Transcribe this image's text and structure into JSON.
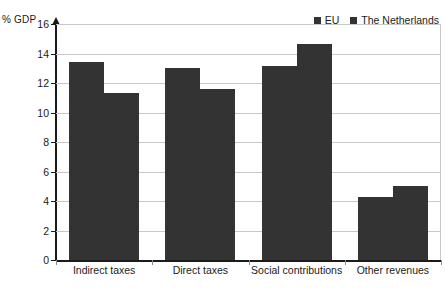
{
  "chart_data": {
    "type": "bar",
    "title": "",
    "subtitle": "",
    "xlabel": "",
    "ylabel": "% GDP",
    "ylim": [
      0,
      16
    ],
    "ytick_step": 2,
    "yticks": [
      16,
      14,
      12,
      10,
      8,
      6,
      4,
      2,
      0
    ],
    "grid": true,
    "legend_position": "top-right",
    "categories": [
      "Indirect taxes",
      "Direct taxes",
      "Social contributions",
      "Other revenues"
    ],
    "series": [
      {
        "name": "EU",
        "color": "#333333",
        "values": [
          13.4,
          13.0,
          13.15,
          4.3
        ]
      },
      {
        "name": "The Netherlands",
        "color": "#333333",
        "values": [
          11.3,
          11.6,
          14.65,
          5.0
        ]
      }
    ]
  },
  "colors": {
    "bar": "#333333",
    "gridline": "#c8c8c8",
    "axis": "#1a1a1a",
    "background": "#ffffff"
  }
}
